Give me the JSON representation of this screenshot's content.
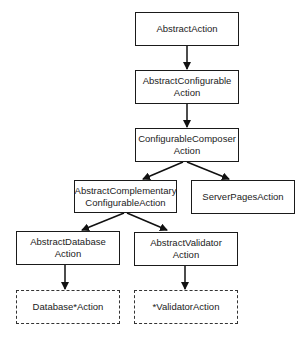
{
  "diagram": {
    "type": "class-hierarchy",
    "nodes": [
      {
        "id": "abstract-action",
        "label": "AbstractAction",
        "style": "solid"
      },
      {
        "id": "abstract-configurable-action",
        "label": "AbstractConfigurable\nAction",
        "style": "solid"
      },
      {
        "id": "configurable-composer-action",
        "label": "ConfigurableComposer\nAction",
        "style": "solid"
      },
      {
        "id": "abstract-complementary-configurable-action",
        "label": "AbstractComplementary\nConfigurableAction",
        "style": "solid"
      },
      {
        "id": "server-pages-action",
        "label": "ServerPagesAction",
        "style": "solid"
      },
      {
        "id": "abstract-database-action",
        "label": "AbstractDatabase\nAction",
        "style": "solid"
      },
      {
        "id": "abstract-validator-action",
        "label": "AbstractValidator\nAction",
        "style": "solid"
      },
      {
        "id": "database-star-action",
        "label": "Database*Action",
        "style": "dashed"
      },
      {
        "id": "star-validator-action",
        "label": "*ValidatorAction",
        "style": "dashed"
      }
    ],
    "edges": [
      {
        "from": "abstract-action",
        "to": "abstract-configurable-action"
      },
      {
        "from": "abstract-configurable-action",
        "to": "configurable-composer-action"
      },
      {
        "from": "configurable-composer-action",
        "to": "abstract-complementary-configurable-action"
      },
      {
        "from": "configurable-composer-action",
        "to": "server-pages-action"
      },
      {
        "from": "abstract-complementary-configurable-action",
        "to": "abstract-database-action"
      },
      {
        "from": "abstract-complementary-configurable-action",
        "to": "abstract-validator-action"
      },
      {
        "from": "abstract-database-action",
        "to": "database-star-action"
      },
      {
        "from": "abstract-validator-action",
        "to": "star-validator-action"
      }
    ]
  },
  "labels": {
    "n0": "AbstractAction",
    "n1a": "AbstractConfigurable",
    "n1b": "Action",
    "n2a": "ConfigurableComposer",
    "n2b": "Action",
    "n3a": "AbstractComplementary",
    "n3b": "ConfigurableAction",
    "n4": "ServerPagesAction",
    "n5a": "AbstractDatabase",
    "n5b": "Action",
    "n6a": "AbstractValidator",
    "n6b": "Action",
    "n7": "Database*Action",
    "n8": "*ValidatorAction"
  }
}
